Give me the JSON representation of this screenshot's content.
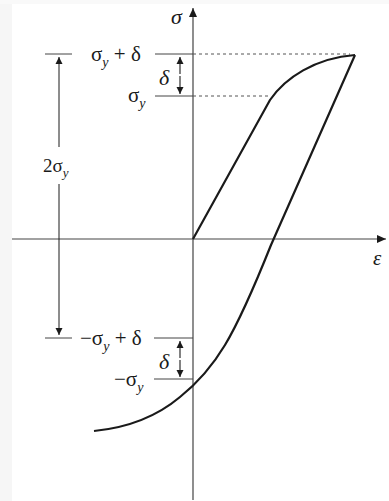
{
  "diagram": {
    "axes": {
      "y_label": "σ",
      "x_label": "ε"
    },
    "levels": {
      "upper_top": {
        "label_main": "σ",
        "label_sub": "y",
        "label_tail": " + δ"
      },
      "upper_yield": {
        "label_main": "σ",
        "label_sub": "y"
      },
      "lower_top": {
        "label_prefix": "−σ",
        "label_sub": "y",
        "label_tail": " + δ"
      },
      "lower_yield": {
        "label_prefix": "−σ",
        "label_sub": "y"
      }
    },
    "delta_label_upper": "δ",
    "delta_label_lower": "δ",
    "span_label": {
      "main": "2σ",
      "sub": "y"
    },
    "colors": {
      "curve": "#1a1a1a",
      "axis": "#444444",
      "dotted": "#555555"
    }
  }
}
